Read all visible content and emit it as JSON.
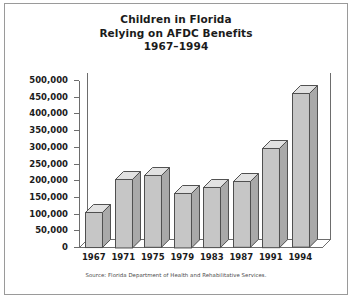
{
  "card": {
    "title_lines": [
      "Children in Florida",
      "Relying on AFDC Benefits",
      "1967–1994"
    ],
    "source": "Source: Florida Department of Health and Rehabilitative Services."
  },
  "chart_data": {
    "type": "bar",
    "title": "Children in Florida Relying on AFDC Benefits 1967–1994",
    "xlabel": "",
    "ylabel": "",
    "categories": [
      "1967",
      "1971",
      "1975",
      "1979",
      "1983",
      "1987",
      "1991",
      "1994"
    ],
    "values": [
      105000,
      205000,
      215000,
      163000,
      180000,
      197000,
      297000,
      460000
    ],
    "ylim": [
      0,
      500000
    ],
    "ytick_labels": [
      "0",
      "50,000",
      "100,000",
      "150,000",
      "200,000",
      "250,000",
      "300,000",
      "350,000",
      "400,000",
      "450,000",
      "500,000"
    ],
    "ytick_values": [
      0,
      50000,
      100000,
      150000,
      200000,
      250000,
      300000,
      350000,
      400000,
      450000,
      500000
    ],
    "grid": false,
    "legend": null,
    "style": "3d-column",
    "colors": {
      "bar_front": "#c6c6c6",
      "bar_top": "#e2e2e2",
      "bar_side": "#a9a9a9",
      "bar_outline": "#4f4f4f",
      "axis": "#6d6d6d",
      "text": "#1b1b1b",
      "card_border": "#9a9a9a",
      "background": "#ffffff"
    }
  }
}
